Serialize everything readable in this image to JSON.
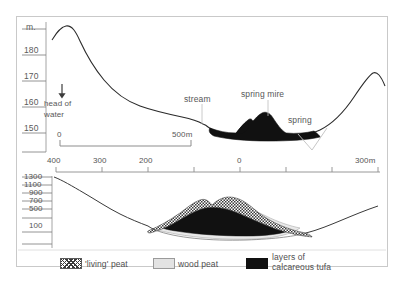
{
  "figure": {
    "title": "",
    "upper_section": {
      "y_axis": {
        "unit_label": "m.",
        "ticks": [
          {
            "value": 190,
            "label": ""
          },
          {
            "value": 180,
            "label": "180"
          },
          {
            "value": 170,
            "label": "170"
          },
          {
            "value": 160,
            "label": "160"
          },
          {
            "value": 150,
            "label": "150"
          }
        ]
      },
      "scale_bar": {
        "start_label": "0",
        "end_label": "500m"
      },
      "annotations": [
        {
          "name": "head-of-water",
          "line1": "head of",
          "line2": "water",
          "icon": "down-arrow-icon"
        },
        {
          "name": "stream",
          "label": "stream"
        },
        {
          "name": "spring-mire",
          "label": "spring mire"
        },
        {
          "name": "spring",
          "label": "spring"
        }
      ]
    },
    "distance_axis": {
      "ticks": [
        {
          "label": "400"
        },
        {
          "label": "300"
        },
        {
          "label": "200"
        },
        {
          "label": ""
        },
        {
          "label": "0"
        },
        {
          "label": ""
        },
        {
          "label": ""
        },
        {
          "label": "300m"
        }
      ]
    },
    "lower_section": {
      "y_axis": {
        "ticks": [
          {
            "label": "1300"
          },
          {
            "label": "1100"
          },
          {
            "label": "900"
          },
          {
            "label": "700"
          },
          {
            "label": "500"
          },
          {
            "label": "100"
          }
        ]
      }
    },
    "legend": {
      "items": [
        {
          "swatch": "checkered",
          "label": "'living' peat"
        },
        {
          "swatch": "light-gray",
          "label": "wood peat"
        },
        {
          "swatch": "black",
          "line1": "layers of",
          "line2": "calcareous tufa"
        }
      ]
    },
    "colors": {
      "tufa": "#111111",
      "wood_peat": "#e3e3e3",
      "living_peat": "#3a3a3a",
      "profile_line": "#2b2b2b",
      "frame": "#c9c9c9",
      "text": "#585858"
    }
  }
}
